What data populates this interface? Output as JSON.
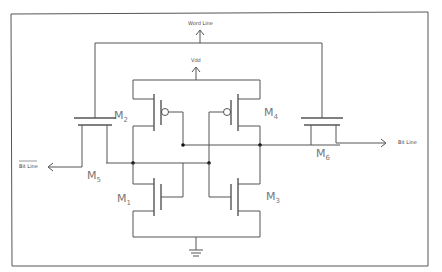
{
  "diagram": {
    "frame_color": "#555555",
    "labels": {
      "word_line": "Word Line",
      "vdd": "Vdd",
      "bit_line": "Bit Line",
      "bit_line_bar": "Bit Line"
    },
    "transistors": [
      {
        "id": "M1",
        "letter": "M",
        "sub": "1",
        "type": "nmos"
      },
      {
        "id": "M2",
        "letter": "M",
        "sub": "2",
        "type": "pmos"
      },
      {
        "id": "M3",
        "letter": "M",
        "sub": "3",
        "type": "nmos"
      },
      {
        "id": "M4",
        "letter": "M",
        "sub": "4",
        "type": "pmos"
      },
      {
        "id": "M5",
        "letter": "M",
        "sub": "5",
        "type": "nmos-access"
      },
      {
        "id": "M6",
        "letter": "M",
        "sub": "6",
        "type": "nmos-access"
      }
    ],
    "ground_symbol": "ground-icon"
  }
}
